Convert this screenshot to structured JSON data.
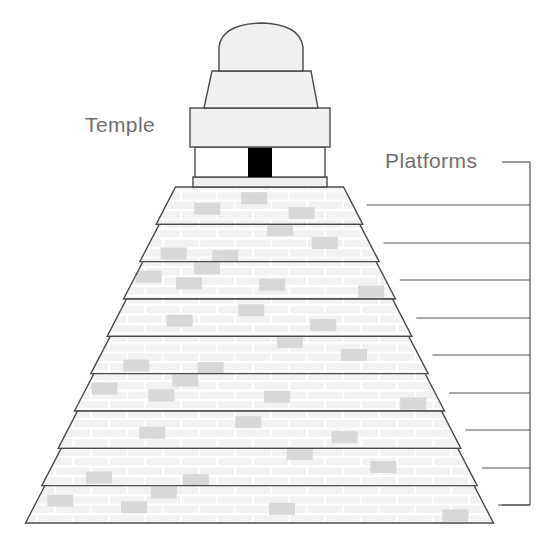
{
  "figure": {
    "background_color": "#ffffff",
    "outline_color": "#4a4a4a",
    "label_color": "#6f6f6f",
    "brick_fill": "#f2f2f2",
    "brick_accent": "#d8d8d8",
    "mortar_color": "#ffffff",
    "doorway_color": "#000000",
    "stone_fill": "#f0f0f0"
  },
  "labels": {
    "temple": "Temple",
    "platforms": "Platforms"
  },
  "temple": {
    "parts": [
      {
        "name": "dome-roof",
        "shape": "dome"
      },
      {
        "name": "upper-tier",
        "shape": "trapezoid"
      },
      {
        "name": "main-band",
        "shape": "rectangle"
      },
      {
        "name": "doorway-band",
        "shape": "rectangle"
      },
      {
        "name": "base-slab",
        "shape": "rectangle"
      },
      {
        "name": "doorway",
        "shape": "rectangle"
      }
    ]
  },
  "platforms": {
    "count": 9,
    "items": [
      {
        "index": 1,
        "top_y": 187,
        "bottom_y": 224,
        "top_half_width": 84,
        "bottom_half_width": 104,
        "leader_y": 205,
        "leader_x_start": 371
      },
      {
        "index": 2,
        "top_y": 224,
        "bottom_y": 261,
        "top_half_width": 104,
        "bottom_half_width": 125,
        "leader_y": 243,
        "leader_x_start": 392
      },
      {
        "index": 3,
        "top_y": 261,
        "bottom_y": 299,
        "top_half_width": 125,
        "bottom_half_width": 147,
        "leader_y": 280,
        "leader_x_start": 414
      },
      {
        "index": 4,
        "top_y": 299,
        "bottom_y": 336,
        "top_half_width": 147,
        "bottom_half_width": 168,
        "leader_y": 318,
        "leader_x_start": 435
      },
      {
        "index": 5,
        "top_y": 336,
        "bottom_y": 374,
        "top_half_width": 168,
        "bottom_half_width": 190,
        "leader_y": 355,
        "leader_x_start": 436
      },
      {
        "index": 6,
        "top_y": 374,
        "bottom_y": 411,
        "top_half_width": 190,
        "bottom_half_width": 211,
        "leader_y": 393,
        "leader_x_start": 434
      },
      {
        "index": 7,
        "top_y": 411,
        "bottom_y": 449,
        "top_half_width": 211,
        "bottom_half_width": 232,
        "leader_y": 430,
        "leader_x_start": 450
      },
      {
        "index": 8,
        "top_y": 449,
        "bottom_y": 486,
        "top_half_width": 232,
        "bottom_half_width": 210,
        "leader_y": 468,
        "leader_x_start": 490
      },
      {
        "index": 9,
        "top_y": 486,
        "bottom_y": 523,
        "top_half_width": 210,
        "bottom_half_width": 231,
        "leader_y": 505,
        "leader_x_start": 510
      }
    ]
  },
  "bracket": {
    "x": 530,
    "top_y": 162,
    "bottom_y": 505,
    "cap_length": 28,
    "label_connector_y": 162
  }
}
